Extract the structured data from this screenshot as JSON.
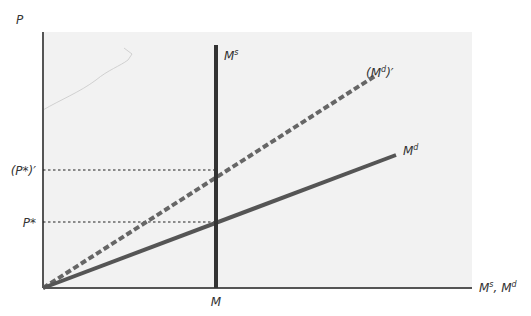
{
  "diagram": {
    "axes": {
      "y_label": "P",
      "x_label_main": "M",
      "x_label_sup_s": "s",
      "x_label_sep": ", ",
      "x_label_sup_d": "d",
      "x_tick": "M"
    },
    "y_ticks": {
      "p_star": "P*",
      "p_star_prime": "(P*)′"
    },
    "curves": {
      "money_supply": {
        "base": "M",
        "sup": "s"
      },
      "money_demand": {
        "base": "M",
        "sup": "d"
      },
      "money_demand_shifted": {
        "open": "(M",
        "sup": "d",
        "close": ")′"
      }
    },
    "colors": {
      "background": "#ffffff",
      "plot_area": "#f2f2f2",
      "axis": "#555555",
      "supply": "#333333",
      "demand": "#555555",
      "demand_shifted": "#666666",
      "guide": "#222222"
    }
  }
}
